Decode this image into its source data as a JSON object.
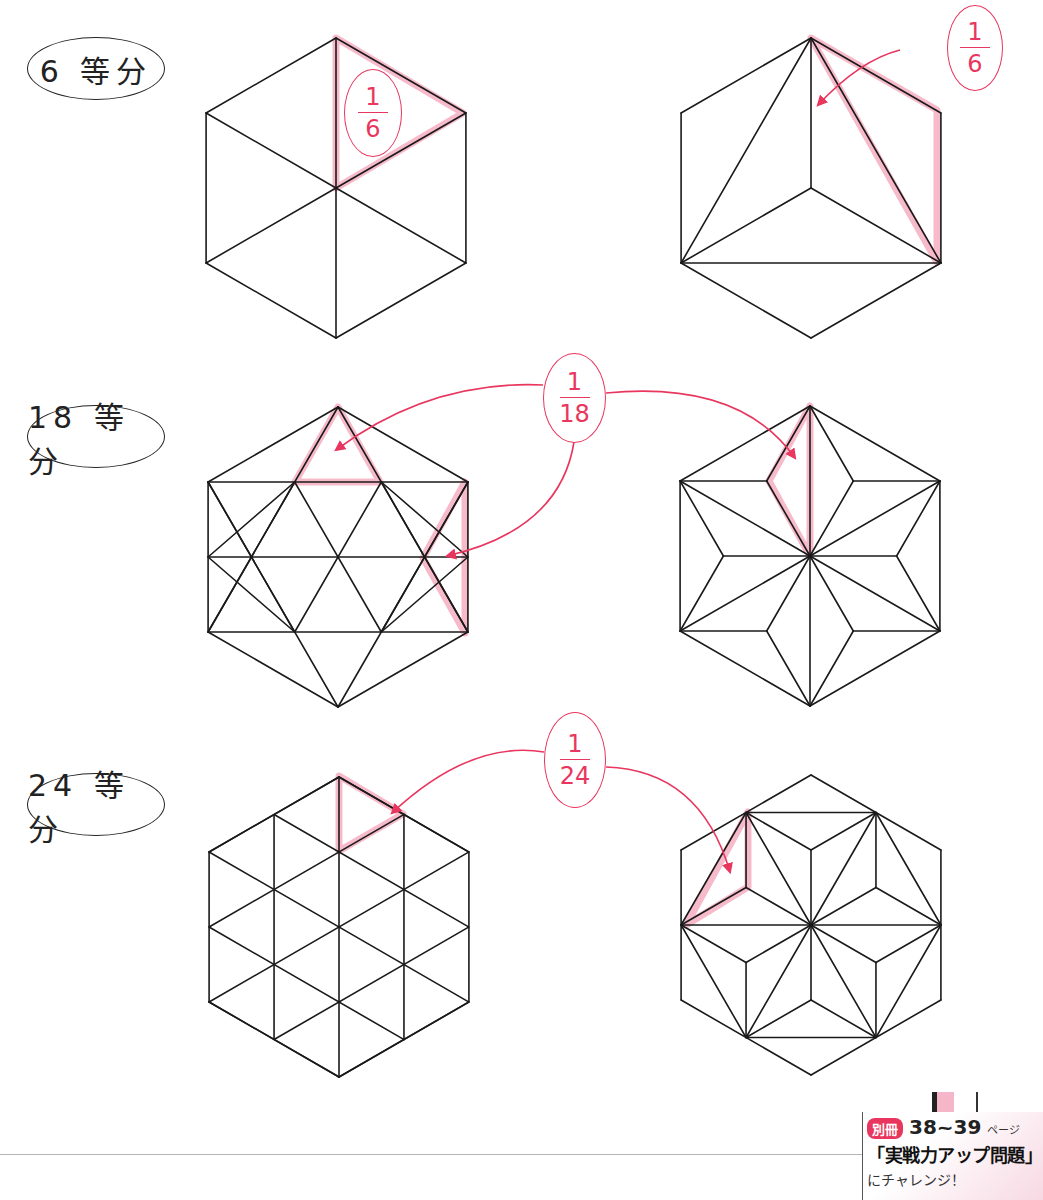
{
  "colors": {
    "line": "#1a1a1a",
    "accent": "#e8365e",
    "highlight": "#f5a9bd",
    "divider": "#b5b5b5"
  },
  "rows": [
    {
      "label": "6 等分",
      "fraction": {
        "num": "1",
        "den": "6"
      }
    },
    {
      "label": "18 等分",
      "fraction": {
        "num": "1",
        "den": "18"
      }
    },
    {
      "label": "24 等分",
      "fraction": {
        "num": "1",
        "den": "24"
      }
    }
  ],
  "labels_pos": [
    {
      "x": 27,
      "y": 37,
      "w": 138,
      "h": 63
    },
    {
      "x": 27,
      "y": 405,
      "w": 138,
      "h": 63
    },
    {
      "x": 27,
      "y": 773,
      "w": 138,
      "h": 63
    }
  ],
  "fraction_ovals": [
    {
      "row": 0,
      "x": 344,
      "y": 69,
      "w": 58,
      "h": 88
    },
    {
      "row": 0,
      "x": 947,
      "y": 5,
      "w": 56,
      "h": 86
    },
    {
      "row": 1,
      "x": 543,
      "y": 353,
      "w": 63,
      "h": 90
    },
    {
      "row": 2,
      "x": 544,
      "y": 712,
      "w": 62,
      "h": 96
    }
  ],
  "hexagons": [
    {
      "id": "hex-6a",
      "cx": 336,
      "cy": 188,
      "r": 150,
      "pattern": "six"
    },
    {
      "id": "hex-6b",
      "cx": 811,
      "cy": 188,
      "r": 150,
      "pattern": "six-b"
    },
    {
      "id": "hex-18a",
      "cx": 338,
      "cy": 557,
      "r": 150,
      "pattern": "tri-grid"
    },
    {
      "id": "hex-18b",
      "cx": 810,
      "cy": 556,
      "r": 150,
      "pattern": "asanoha"
    },
    {
      "id": "hex-24a",
      "cx": 339,
      "cy": 927,
      "r": 150,
      "pattern": "grid24"
    },
    {
      "id": "hex-24b",
      "cx": 811,
      "cy": 925,
      "r": 150,
      "pattern": "star24"
    }
  ],
  "highlights": [
    [
      [
        336,
        38
      ],
      [
        463,
        113
      ],
      [
        336,
        188
      ]
    ],
    [
      [
        811,
        38
      ],
      [
        937,
        110
      ],
      [
        937,
        262
      ]
    ],
    [
      [
        338,
        407
      ],
      [
        380,
        482
      ],
      [
        295,
        482
      ]
    ],
    [
      [
        465,
        482
      ],
      [
        465,
        633
      ],
      [
        423,
        558
      ]
    ],
    [
      [
        810,
        406
      ],
      [
        810,
        556
      ],
      [
        769,
        481
      ]
    ],
    [
      [
        339,
        776
      ],
      [
        403,
        814
      ],
      [
        339,
        851
      ]
    ],
    [
      [
        686,
        925
      ],
      [
        748,
        812
      ],
      [
        748,
        887
      ]
    ]
  ],
  "arrows": [
    {
      "d": "M 900 50 Q 860 60 818 105"
    },
    {
      "d": "M 543 385 Q 430 380 336 450"
    },
    {
      "d": "M 574 442 Q 560 530 447 556"
    },
    {
      "d": "M 606 393 Q 740 380 795 458"
    },
    {
      "d": "M 544 752 Q 470 740 392 813"
    },
    {
      "d": "M 606 767 Q 700 770 730 872"
    }
  ],
  "badge": {
    "tag": "別冊",
    "pages": "38~39",
    "page_suffix": "ページ",
    "title": "「実戦力アップ問題」",
    "cta": "にチャレンジ！"
  }
}
